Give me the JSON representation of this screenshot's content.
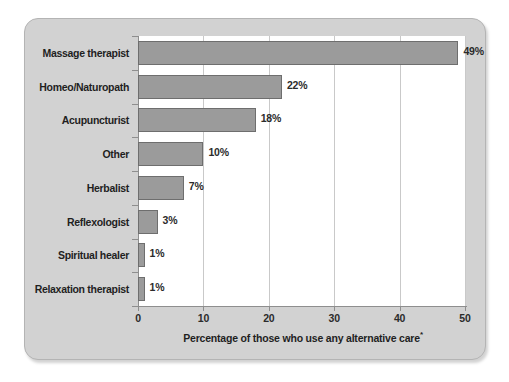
{
  "chart_data": {
    "type": "bar",
    "orientation": "horizontal",
    "title": "",
    "xlabel": "Percentage of those who use any alternative care*",
    "ylabel": "",
    "xlim": [
      0,
      50
    ],
    "xticks": [
      0,
      10,
      20,
      30,
      40,
      50
    ],
    "xtick_labels": [
      "0",
      "10",
      "20",
      "30",
      "40",
      "50"
    ],
    "grid": "vertical",
    "legend": "none",
    "footnote_marker": "*",
    "categories": [
      "Massage therapist",
      "Homeo/Naturopath",
      "Acupuncturist",
      "Other",
      "Herbalist",
      "Reflexologist",
      "Spiritual healer",
      "Relaxation therapist"
    ],
    "values": [
      49,
      22,
      18,
      10,
      7,
      3,
      1,
      1
    ],
    "value_labels": [
      "49%",
      "22%",
      "18%",
      "10%",
      "7%",
      "3%",
      "1%",
      "1%"
    ],
    "colors": {
      "bar_fill": "#9b9b9b",
      "bar_edge": "#6e6e6e",
      "panel_background": "#d2d2d2",
      "plot_background": "#ffffff",
      "gridline": "#c9c9c9",
      "axis_line": "#8e8e8e",
      "text": "#1f1f1f"
    }
  }
}
